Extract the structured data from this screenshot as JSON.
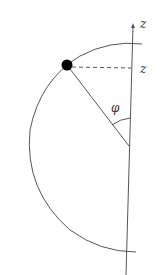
{
  "diagram": {
    "axis_label": "z",
    "height_label": "z",
    "angle_label": "φ",
    "colors": {
      "stroke": "#555555",
      "dot": "#000000",
      "background": "#ffffff"
    }
  }
}
